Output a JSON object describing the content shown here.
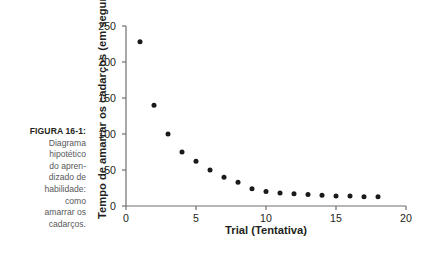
{
  "caption": {
    "label": "FIGURA 16-1:",
    "text": "Diagrama\nhipotético\ndo apren-\ndizado de\nhabilidade:\ncomo\namarrar os\ncadarços."
  },
  "colors": {
    "dot": "#1a1a1a",
    "axis": "#6d6e71",
    "text": "#231f20",
    "caption_text": "#58595b",
    "background": "#ffffff"
  },
  "chart_data": {
    "type": "scatter",
    "title": "",
    "xlabel": "Trial (Tentativa)",
    "ylabel": "Tempo de amarrar os cadarços (em segundos)",
    "xlim": [
      0,
      20
    ],
    "ylim": [
      0,
      250
    ],
    "xticks": [
      0,
      5,
      10,
      15,
      20
    ],
    "yticks": [
      0,
      50,
      100,
      150,
      200,
      250
    ],
    "xtick_labels": [
      "0",
      "5",
      "10",
      "15",
      "20"
    ],
    "ytick_labels": [
      "0",
      "50",
      "100",
      "150",
      "200",
      "250"
    ],
    "grid": false,
    "legend": false,
    "series": [
      {
        "name": "Tempo por tentativa",
        "marker": "circle",
        "x": [
          1,
          2,
          3,
          4,
          5,
          6,
          7,
          8,
          9,
          10,
          11,
          12,
          13,
          14,
          15,
          16,
          17,
          18
        ],
        "y": [
          228,
          140,
          100,
          75,
          62,
          50,
          40,
          33,
          24,
          20,
          18,
          17,
          16,
          15,
          14,
          14,
          13,
          13
        ]
      }
    ]
  }
}
